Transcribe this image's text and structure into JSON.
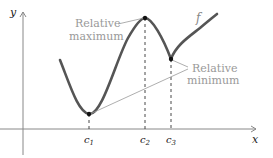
{
  "axes": {
    "x_label": "x",
    "y_label": "y"
  },
  "function_label": "f",
  "critical_points": [
    {
      "label": "c",
      "subscript": "1",
      "type": "relative minimum"
    },
    {
      "label": "c",
      "subscript": "2",
      "type": "relative maximum"
    },
    {
      "label": "c",
      "subscript": "3",
      "type": "relative minimum"
    }
  ],
  "annotations": {
    "max_line1": "Relative",
    "max_line2": "maximum",
    "min_line1": "Relative",
    "min_line2": "minimum"
  },
  "colors": {
    "curve": "#555555",
    "axes": "#888888",
    "annotation_text": "#999999",
    "points": "#111111"
  }
}
